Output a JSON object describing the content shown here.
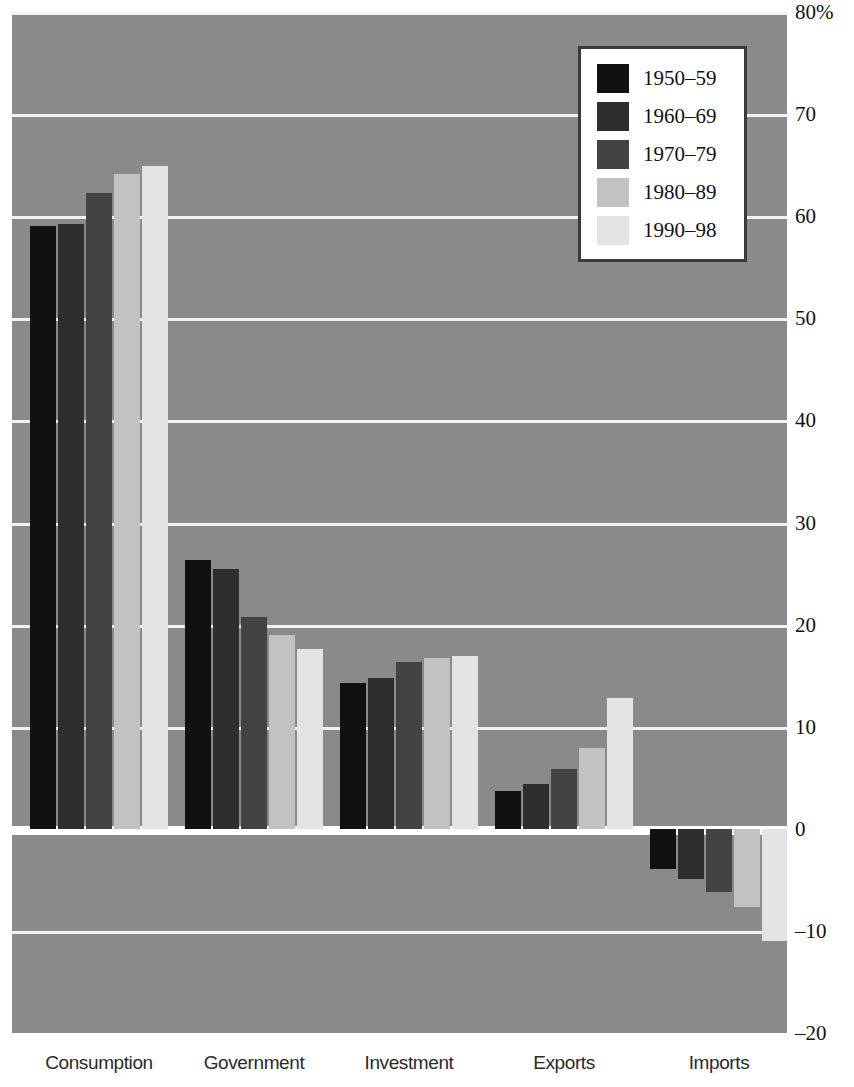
{
  "chart_data": {
    "type": "bar",
    "title": "",
    "subtitle": "",
    "xlabel": "",
    "ylabel": "",
    "unit": "%",
    "ylim": [
      -20,
      80
    ],
    "yticks": [
      80,
      70,
      60,
      50,
      40,
      30,
      20,
      10,
      0,
      -10,
      -20
    ],
    "ytick_labels": [
      "80%",
      "70",
      "60",
      "50",
      "40",
      "30",
      "20",
      "10",
      "0",
      "–10",
      "–20"
    ],
    "grid": true,
    "legend_position": "top-right",
    "categories": [
      "Consumption",
      "Government",
      "Investment",
      "Exports",
      "Imports"
    ],
    "series": [
      {
        "name": "1950–59",
        "color": "#111111",
        "values": [
          59,
          26.3,
          14.3,
          3.7,
          -3.9
        ]
      },
      {
        "name": "1960–69",
        "color": "#2e2e2e",
        "values": [
          59.2,
          25.4,
          14.8,
          4.4,
          -4.9
        ]
      },
      {
        "name": "1970–79",
        "color": "#434343",
        "values": [
          62.3,
          20.7,
          16.3,
          5.9,
          -6.2
        ]
      },
      {
        "name": "1980–89",
        "color": "#c2c2c2",
        "values": [
          64.1,
          19.0,
          16.7,
          7.9,
          -7.7
        ]
      },
      {
        "name": "1990–98",
        "color": "#e3e3e3",
        "values": [
          64.9,
          17.6,
          16.9,
          12.8,
          -11.0
        ]
      }
    ],
    "plot_background": "#8a8a8a",
    "gridline_color": "#f2f2f2",
    "zero_line_color": "#ffffff"
  },
  "legend": {
    "items": [
      {
        "label": "1950–59"
      },
      {
        "label": "1960–69"
      },
      {
        "label": "1970–79"
      },
      {
        "label": "1980–89"
      },
      {
        "label": "1990–98"
      }
    ]
  }
}
